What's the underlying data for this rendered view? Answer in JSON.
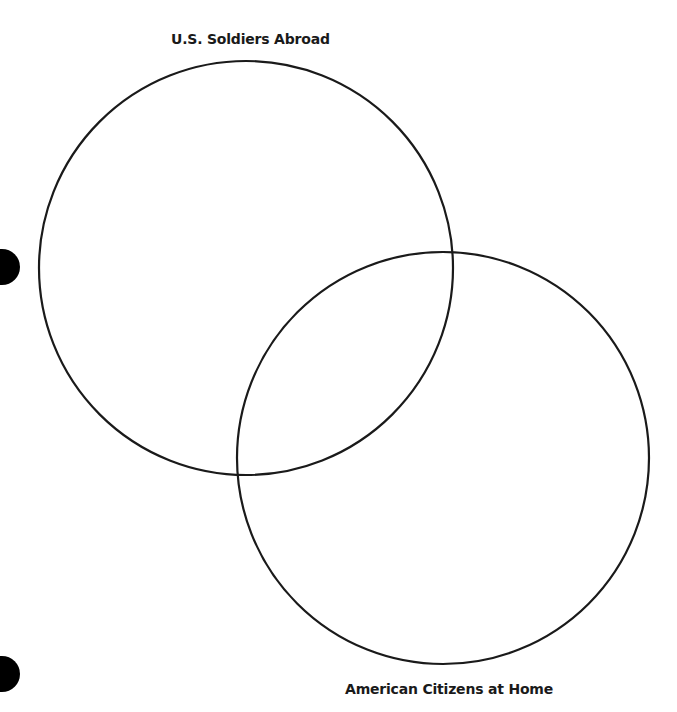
{
  "diagram": {
    "type": "venn",
    "sets": [
      {
        "label": "U.S. Soldiers Abroad",
        "cx": 246,
        "cy": 268,
        "r": 207
      },
      {
        "label": "American Citizens at Home",
        "cx": 443,
        "cy": 458,
        "r": 206
      }
    ],
    "stroke_color": "#1a1a1a",
    "background": "#ffffff"
  },
  "labels": {
    "top": "U.S. Soldiers Abroad",
    "bottom": "American Citizens at Home"
  }
}
